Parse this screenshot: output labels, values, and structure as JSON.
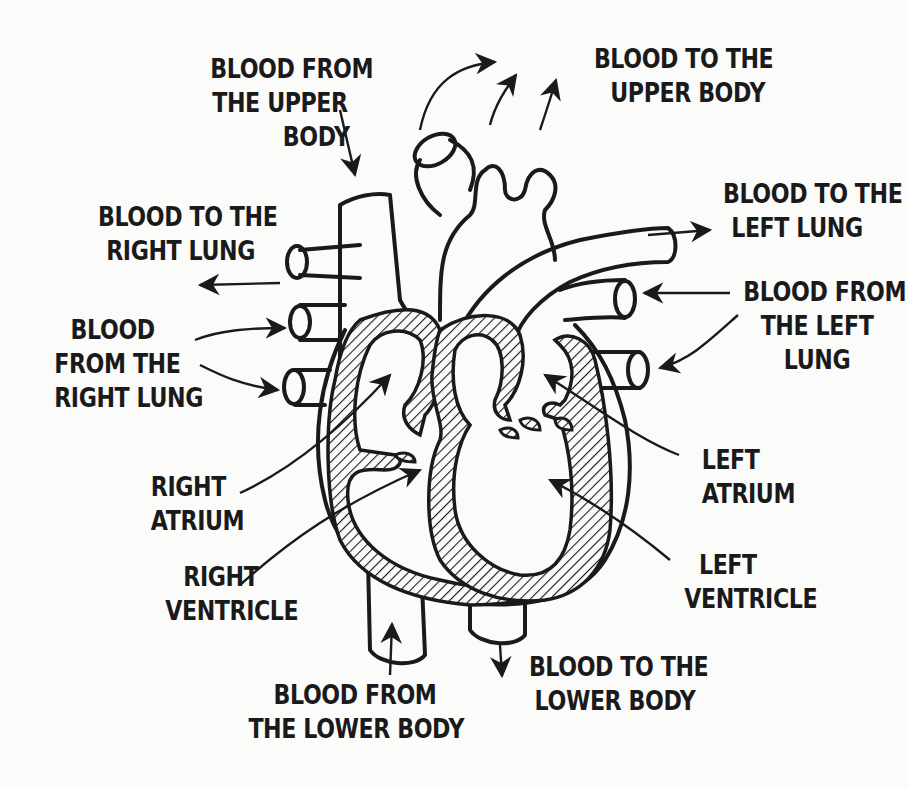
{
  "diagram": {
    "colors": {
      "background": "#fbfbfa",
      "ink": "#1a1a1a"
    },
    "labels": {
      "blood_from_upper_body": [
        "BLOOD FROM",
        "THE UPPER",
        "BODY"
      ],
      "blood_to_upper_body": [
        "BLOOD TO THE",
        "UPPER BODY"
      ],
      "blood_to_right_lung": [
        "BLOOD TO THE",
        "RIGHT LUNG"
      ],
      "blood_to_left_lung": [
        "BLOOD TO THE",
        "LEFT LUNG"
      ],
      "blood_from_right_lung": [
        "BLOOD",
        "FROM THE",
        "RIGHT LUNG"
      ],
      "blood_from_left_lung": [
        "BLOOD FROM",
        "THE LEFT",
        "LUNG"
      ],
      "right_atrium": [
        "RIGHT",
        "ATRIUM"
      ],
      "left_atrium": [
        "LEFT",
        "ATRIUM"
      ],
      "right_ventricle": [
        "RIGHT",
        "VENTRICLE"
      ],
      "left_ventricle": [
        "LEFT",
        "VENTRICLE"
      ],
      "blood_from_lower_body": [
        "BLOOD FROM",
        "THE LOWER BODY"
      ],
      "blood_to_lower_body": [
        "BLOOD TO THE",
        "LOWER BODY"
      ]
    }
  }
}
